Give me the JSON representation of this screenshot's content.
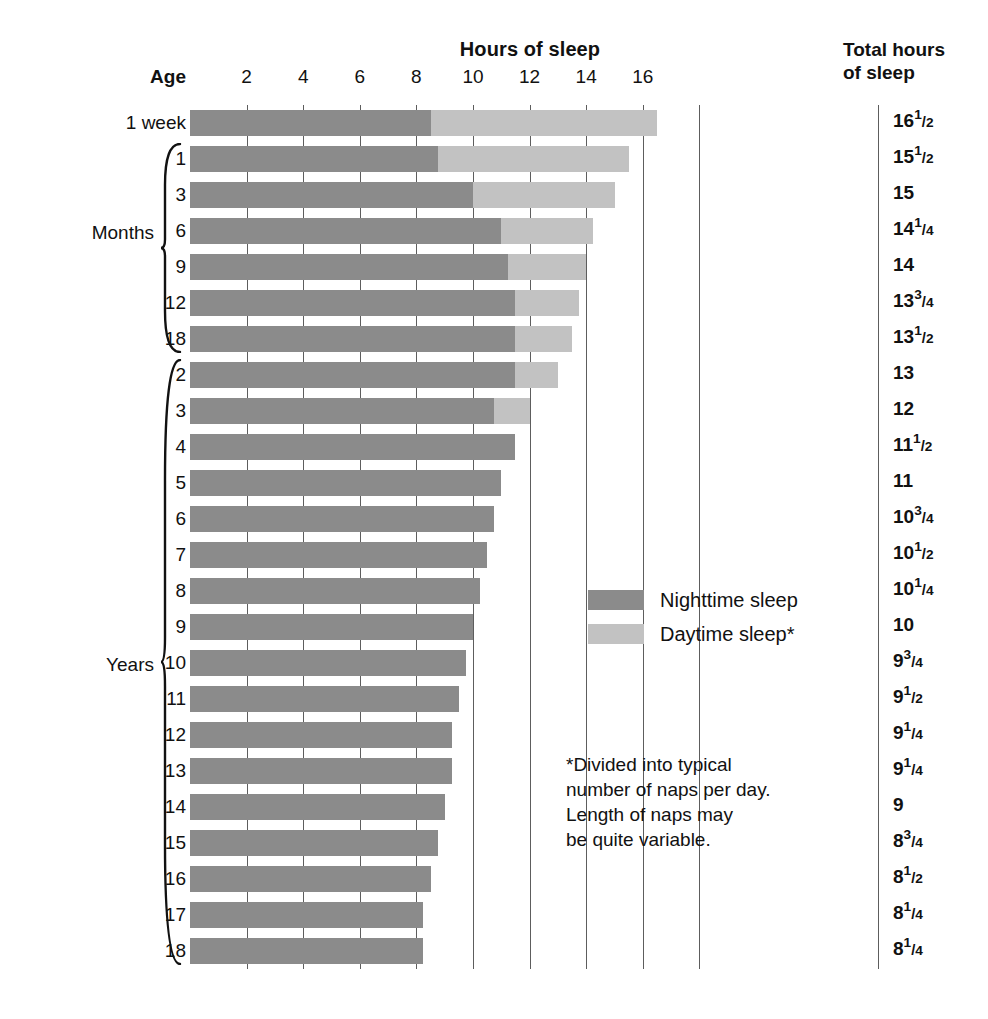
{
  "header": {
    "hours_title": "Hours of sleep",
    "total_title_line1": "Total hours",
    "total_title_line2": "of sleep",
    "age_label": "Age"
  },
  "axis": {
    "ticks": [
      "2",
      "4",
      "6",
      "8",
      "10",
      "12",
      "14",
      "16"
    ],
    "unit": "hours",
    "min": 0,
    "max": 18
  },
  "groups": {
    "months_label": "Months",
    "years_label": "Years"
  },
  "legend": {
    "items": [
      {
        "label": "Nighttime sleep",
        "color": "#8b8b8b",
        "name": "nighttime-sleep"
      },
      {
        "label": "Daytime sleep*",
        "color": "#c2c2c2",
        "name": "daytime-sleep"
      }
    ]
  },
  "footnote": {
    "line1": "*Divided into typical",
    "line2": "number of naps per day.",
    "line3": "Length of naps may",
    "line4": "be quite variable."
  },
  "colors": {
    "night": "#8b8b8b",
    "day": "#c2c2c2",
    "rule": "#5d5d5d",
    "text": "#111111",
    "background": "#ffffff"
  },
  "chart_data": {
    "type": "bar",
    "orientation": "horizontal",
    "stacked": true,
    "title": "Hours of sleep",
    "xlabel": "Hours of sleep",
    "ylabel": "Age",
    "xlim": [
      0,
      18
    ],
    "xticks": [
      2,
      4,
      6,
      8,
      10,
      12,
      14,
      16
    ],
    "grid": true,
    "legend_position": "inside-right",
    "series": [
      {
        "name": "Nighttime sleep",
        "color": "#8b8b8b"
      },
      {
        "name": "Daytime sleep*",
        "color": "#c2c2c2"
      }
    ],
    "categories": [
      "1 week",
      "1",
      "3",
      "6",
      "9",
      "12",
      "18",
      "2",
      "3",
      "4",
      "5",
      "6",
      "7",
      "8",
      "9",
      "10",
      "11",
      "12",
      "13",
      "14",
      "15",
      "16",
      "17",
      "18"
    ],
    "rows": [
      {
        "age": "1 week",
        "group": "",
        "night": 8.5,
        "day": 8.0,
        "total": 16.5,
        "total_text": "16 1/2"
      },
      {
        "age": "1",
        "group": "Months",
        "night": 8.75,
        "day": 6.75,
        "total": 15.5,
        "total_text": "15 1/2"
      },
      {
        "age": "3",
        "group": "Months",
        "night": 10.0,
        "day": 5.0,
        "total": 15,
        "total_text": "15"
      },
      {
        "age": "6",
        "group": "Months",
        "night": 11.0,
        "day": 3.25,
        "total": 14.25,
        "total_text": "14 1/4"
      },
      {
        "age": "9",
        "group": "Months",
        "night": 11.25,
        "day": 2.75,
        "total": 14,
        "total_text": "14"
      },
      {
        "age": "12",
        "group": "Months",
        "night": 11.5,
        "day": 2.25,
        "total": 13.75,
        "total_text": "13 3/4"
      },
      {
        "age": "18",
        "group": "Months",
        "night": 11.5,
        "day": 2.0,
        "total": 13.5,
        "total_text": "13 1/2"
      },
      {
        "age": "2",
        "group": "Years",
        "night": 11.5,
        "day": 1.5,
        "total": 13,
        "total_text": "13"
      },
      {
        "age": "3",
        "group": "Years",
        "night": 10.75,
        "day": 1.25,
        "total": 12,
        "total_text": "12"
      },
      {
        "age": "4",
        "group": "Years",
        "night": 11.5,
        "day": 0,
        "total": 11.5,
        "total_text": "11 1/2"
      },
      {
        "age": "5",
        "group": "Years",
        "night": 11.0,
        "day": 0,
        "total": 11,
        "total_text": "11"
      },
      {
        "age": "6",
        "group": "Years",
        "night": 10.75,
        "day": 0,
        "total": 10.75,
        "total_text": "10 3/4"
      },
      {
        "age": "7",
        "group": "Years",
        "night": 10.5,
        "day": 0,
        "total": 10.5,
        "total_text": "10 1/2"
      },
      {
        "age": "8",
        "group": "Years",
        "night": 10.25,
        "day": 0,
        "total": 10.25,
        "total_text": "10 1/4"
      },
      {
        "age": "9",
        "group": "Years",
        "night": 10.0,
        "day": 0,
        "total": 10,
        "total_text": "10"
      },
      {
        "age": "10",
        "group": "Years",
        "night": 9.75,
        "day": 0,
        "total": 9.75,
        "total_text": "9 3/4"
      },
      {
        "age": "11",
        "group": "Years",
        "night": 9.5,
        "day": 0,
        "total": 9.5,
        "total_text": "9 1/2"
      },
      {
        "age": "12",
        "group": "Years",
        "night": 9.25,
        "day": 0,
        "total": 9.25,
        "total_text": "9 1/4"
      },
      {
        "age": "13",
        "group": "Years",
        "night": 9.25,
        "day": 0,
        "total": 9.25,
        "total_text": "9 1/4"
      },
      {
        "age": "14",
        "group": "Years",
        "night": 9.0,
        "day": 0,
        "total": 9,
        "total_text": "9"
      },
      {
        "age": "15",
        "group": "Years",
        "night": 8.75,
        "day": 0,
        "total": 8.75,
        "total_text": "8 3/4"
      },
      {
        "age": "16",
        "group": "Years",
        "night": 8.5,
        "day": 0,
        "total": 8.5,
        "total_text": "8 1/2"
      },
      {
        "age": "17",
        "group": "Years",
        "night": 8.25,
        "day": 0,
        "total": 8.25,
        "total_text": "8 1/4"
      },
      {
        "age": "18",
        "group": "Years",
        "night": 8.25,
        "day": 0,
        "total": 8.25,
        "total_text": "8 1/4"
      }
    ]
  }
}
